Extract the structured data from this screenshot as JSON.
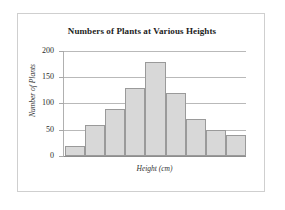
{
  "chart_data": {
    "type": "bar",
    "title": "Numbers of Plants at Various Heights",
    "xlabel": "Height (cm)",
    "ylabel": "Number of Plants",
    "categories": [
      "1",
      "2",
      "3",
      "4",
      "5",
      "6",
      "7",
      "8",
      "9"
    ],
    "values": [
      20,
      60,
      90,
      130,
      180,
      120,
      70,
      50,
      40
    ],
    "ylim": [
      0,
      200
    ],
    "yticks": [
      0,
      50,
      100,
      150,
      200
    ],
    "ytick_labels": [
      "0",
      "50",
      "100",
      "150",
      "200"
    ],
    "xtick_labels": [],
    "grid": true,
    "legend": null,
    "bar_fill": "#d8d8d8",
    "bar_border": "#9a9a9a",
    "grid_color": "#b9b9b9",
    "frame_color": "#cfcfcf"
  }
}
